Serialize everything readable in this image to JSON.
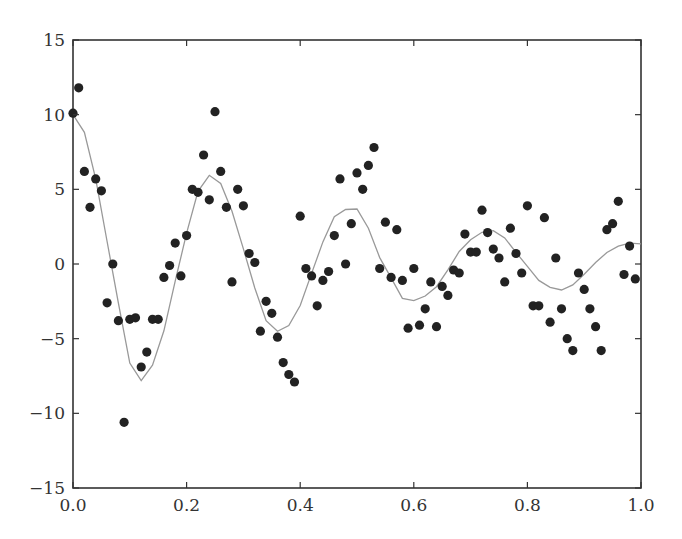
{
  "chart_data": {
    "type": "scatter",
    "title": "",
    "xlabel": "",
    "ylabel": "",
    "xlim": [
      0.0,
      1.0
    ],
    "ylim": [
      -15,
      15
    ],
    "grid": false,
    "legend": null,
    "x_ticks": [
      "0.0",
      "0.2",
      "0.4",
      "0.6",
      "0.8",
      "1.0"
    ],
    "y_ticks": [
      "−15",
      "−10",
      "−5",
      "0",
      "5",
      "10",
      "15"
    ],
    "series": [
      {
        "name": "samples",
        "kind": "scatter",
        "color": "#222222",
        "x": [
          0.0,
          0.01,
          0.02,
          0.03,
          0.04,
          0.05,
          0.06,
          0.07,
          0.08,
          0.09,
          0.1,
          0.11,
          0.12,
          0.13,
          0.14,
          0.15,
          0.16,
          0.17,
          0.18,
          0.19,
          0.2,
          0.21,
          0.22,
          0.23,
          0.24,
          0.25,
          0.26,
          0.27,
          0.28,
          0.29,
          0.3,
          0.31,
          0.32,
          0.33,
          0.34,
          0.35,
          0.36,
          0.37,
          0.38,
          0.39,
          0.4,
          0.41,
          0.42,
          0.43,
          0.44,
          0.45,
          0.46,
          0.47,
          0.48,
          0.49,
          0.5,
          0.51,
          0.52,
          0.53,
          0.54,
          0.55,
          0.56,
          0.57,
          0.58,
          0.59,
          0.6,
          0.61,
          0.62,
          0.63,
          0.64,
          0.65,
          0.66,
          0.67,
          0.68,
          0.69,
          0.7,
          0.71,
          0.72,
          0.73,
          0.74,
          0.75,
          0.76,
          0.77,
          0.78,
          0.79,
          0.8,
          0.81,
          0.82,
          0.83,
          0.84,
          0.85,
          0.86,
          0.87,
          0.88,
          0.89,
          0.9,
          0.91,
          0.92,
          0.93,
          0.94,
          0.95,
          0.96,
          0.97,
          0.98,
          0.99
        ],
        "y": [
          10.1,
          11.8,
          6.2,
          3.8,
          5.7,
          4.9,
          -2.6,
          0.0,
          -3.8,
          -10.6,
          -3.7,
          -3.6,
          -6.9,
          -5.9,
          -3.7,
          -3.7,
          -0.9,
          -0.1,
          1.4,
          -0.8,
          1.9,
          5.0,
          4.8,
          7.3,
          4.3,
          10.2,
          6.2,
          3.8,
          -1.2,
          5.0,
          3.9,
          0.7,
          0.1,
          -4.5,
          -2.5,
          -3.3,
          -4.9,
          -6.6,
          -7.4,
          -7.9,
          3.2,
          -0.3,
          -0.8,
          -2.8,
          -1.1,
          -0.5,
          1.9,
          5.7,
          0.0,
          2.7,
          6.1,
          5.0,
          6.6,
          7.8,
          -0.3,
          2.8,
          -0.9,
          2.3,
          -1.1,
          -4.3,
          -0.3,
          -4.1,
          -3.0,
          -1.2,
          -4.2,
          -1.5,
          -2.1,
          -0.4,
          -0.6,
          2.0,
          0.8,
          0.8,
          3.6,
          2.1,
          1.0,
          0.4,
          -1.2,
          2.4,
          0.7,
          -0.6,
          3.9,
          -2.8,
          -2.8,
          3.1,
          -3.9,
          0.4,
          -3.0,
          -5.0,
          -5.8,
          -0.6,
          -1.7,
          -3.0,
          -4.2,
          -5.8,
          2.3,
          2.7,
          4.2,
          -0.7,
          1.2,
          -1.0
        ]
      },
      {
        "name": "fit",
        "kind": "line",
        "color": "#999999",
        "formula": "10*exp(-2x)*cos(8*pi*x)",
        "x": [
          0.0,
          0.02,
          0.04,
          0.06,
          0.08,
          0.1,
          0.12,
          0.14,
          0.16,
          0.18,
          0.2,
          0.22,
          0.24,
          0.26,
          0.28,
          0.3,
          0.32,
          0.34,
          0.36,
          0.38,
          0.4,
          0.42,
          0.44,
          0.46,
          0.48,
          0.5,
          0.52,
          0.54,
          0.56,
          0.58,
          0.6,
          0.62,
          0.64,
          0.66,
          0.68,
          0.7,
          0.72,
          0.74,
          0.76,
          0.78,
          0.8,
          0.82,
          0.84,
          0.86,
          0.88,
          0.9,
          0.92,
          0.94,
          0.96,
          0.98,
          1.0
        ],
        "y": [
          10.0,
          8.82,
          5.7,
          1.51,
          -2.62,
          -6.63,
          -7.81,
          -6.77,
          -4.47,
          -1.15,
          2.06,
          4.87,
          5.94,
          5.39,
          3.53,
          1.01,
          -1.61,
          -3.79,
          -4.51,
          -4.12,
          -2.78,
          -0.63,
          1.48,
          3.16,
          3.65,
          3.68,
          2.4,
          0.43,
          -0.93,
          -2.3,
          -2.45,
          -2.14,
          -1.52,
          -0.39,
          0.84,
          1.63,
          2.12,
          2.23,
          1.75,
          0.78,
          -0.16,
          -1.1,
          -1.56,
          -1.74,
          -1.4,
          -0.69,
          0.1,
          0.77,
          1.19,
          1.4,
          1.35
        ]
      }
    ]
  }
}
